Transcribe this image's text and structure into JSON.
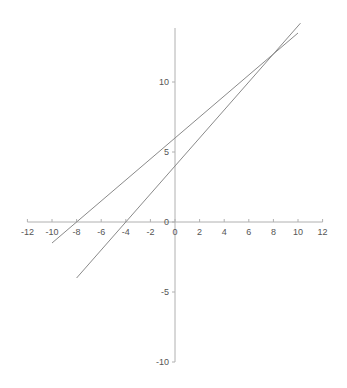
{
  "chart_data": {
    "type": "line",
    "title": "",
    "xlabel": "",
    "ylabel": "",
    "xlim": [
      -12,
      12
    ],
    "ylim": [
      -10,
      14
    ],
    "grid": false,
    "legend": "none",
    "x_ticks": [
      -12,
      -10,
      -8,
      -6,
      -4,
      -2,
      0,
      2,
      4,
      6,
      8,
      10,
      12
    ],
    "y_ticks": [
      -10,
      -5,
      0,
      5,
      10
    ],
    "x_tick_labels": [
      "-12",
      "-10",
      "-8",
      "-6",
      "-4",
      "-2",
      "0",
      "2",
      "4",
      "6",
      "8",
      "10",
      "12"
    ],
    "y_tick_labels": [
      "-10",
      "-5",
      "0",
      "5",
      "10"
    ],
    "series": [
      {
        "name": "y = 0.75x + 6",
        "x": [
          -10,
          10
        ],
        "y": [
          -1.5,
          13.5
        ],
        "color": "#8a8a8a"
      },
      {
        "name": "y = x + 4",
        "x": [
          -8,
          10.2
        ],
        "y": [
          -4,
          14.2
        ],
        "color": "#8a8a8a"
      }
    ]
  }
}
